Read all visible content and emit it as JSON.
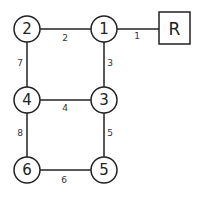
{
  "diagram": {
    "root": {
      "label": "R"
    },
    "nodes": [
      {
        "id": "1",
        "label": "1"
      },
      {
        "id": "2",
        "label": "2"
      },
      {
        "id": "3",
        "label": "3"
      },
      {
        "id": "4",
        "label": "4"
      },
      {
        "id": "5",
        "label": "5"
      },
      {
        "id": "6",
        "label": "6"
      }
    ],
    "edges": [
      {
        "from": "R",
        "to": "1",
        "weight": "1"
      },
      {
        "from": "1",
        "to": "2",
        "weight": "2"
      },
      {
        "from": "1",
        "to": "3",
        "weight": "3"
      },
      {
        "from": "3",
        "to": "4",
        "weight": "4"
      },
      {
        "from": "3",
        "to": "5",
        "weight": "5"
      },
      {
        "from": "5",
        "to": "6",
        "weight": "6"
      },
      {
        "from": "2",
        "to": "4",
        "weight": "7"
      },
      {
        "from": "4",
        "to": "6",
        "weight": "8"
      }
    ]
  }
}
